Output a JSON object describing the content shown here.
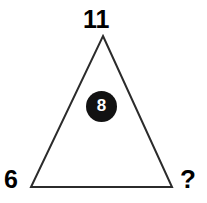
{
  "figure": {
    "kind": "triangle-number-puzzle",
    "background_color": "#ffffff",
    "stroke_color": "#2b2b2b",
    "stroke_width": 2,
    "triangle": {
      "apex": {
        "x": 103,
        "y": 36
      },
      "bottom_left": {
        "x": 31,
        "y": 187
      },
      "bottom_right": {
        "x": 172,
        "y": 187
      }
    }
  },
  "labels": {
    "apex": "11",
    "bottom_left": "6",
    "bottom_right": "?"
  },
  "center": {
    "value": "8",
    "fill_color": "#121212",
    "text_color": "#ffffff"
  }
}
